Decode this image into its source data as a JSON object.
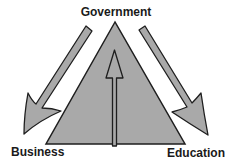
{
  "diagram": {
    "title": "",
    "nodes": {
      "top": "Government",
      "bottom_left": "Business",
      "bottom_right": "Education"
    },
    "shapes": {
      "triangle": "central triangle",
      "arrows": [
        {
          "from": "Government",
          "to": "Business",
          "direction": "down-left"
        },
        {
          "from": "Government",
          "to": "Education",
          "direction": "down-right"
        },
        {
          "from": "base",
          "to": "Government",
          "direction": "up"
        }
      ]
    },
    "colors": {
      "fill": "#a9a9a9",
      "stroke": "#1e1e1e",
      "text": "#1a1a1a",
      "background": "#ffffff"
    }
  }
}
